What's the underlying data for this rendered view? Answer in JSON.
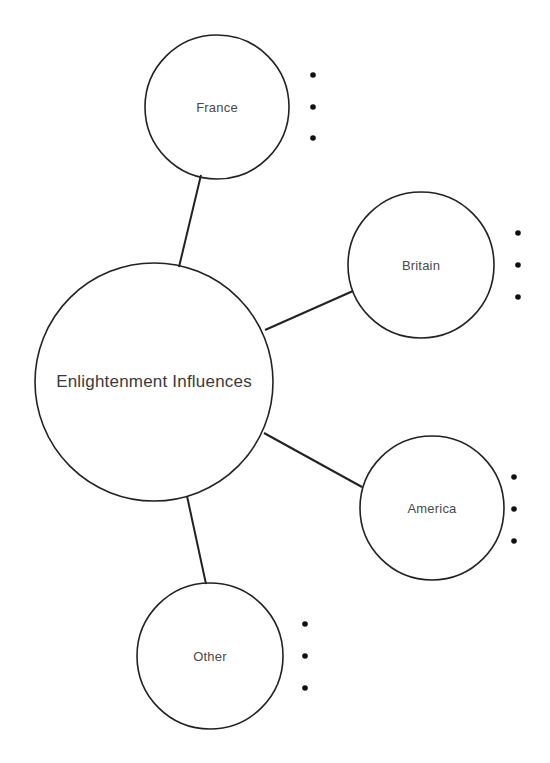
{
  "diagram": {
    "type": "mind-map",
    "stroke_color": "#222222",
    "text_color": "#4a4a4a",
    "background": "#ffffff",
    "center": {
      "label": "Enlightenment Influences",
      "cx": 154,
      "cy": 382,
      "r": 119
    },
    "nodes": [
      {
        "id": "france",
        "label": "France",
        "cx": 217,
        "cy": 107,
        "r": 72,
        "connector": [
          201,
          175,
          179,
          267
        ],
        "bullets": [
          {
            "x": 313,
            "y": 75
          },
          {
            "x": 313,
            "y": 107
          },
          {
            "x": 313,
            "y": 138
          }
        ]
      },
      {
        "id": "britain",
        "label": "Britain",
        "cx": 421,
        "cy": 265,
        "r": 73,
        "connector": [
          353,
          291,
          265,
          330
        ],
        "bullets": [
          {
            "x": 518,
            "y": 233
          },
          {
            "x": 518,
            "y": 265
          },
          {
            "x": 518,
            "y": 297
          }
        ]
      },
      {
        "id": "america",
        "label": "America",
        "cx": 432,
        "cy": 508,
        "r": 72,
        "connector": [
          264,
          433,
          362,
          487
        ],
        "bullets": [
          {
            "x": 514,
            "y": 477
          },
          {
            "x": 514,
            "y": 509
          },
          {
            "x": 514,
            "y": 541
          }
        ]
      },
      {
        "id": "other",
        "label": "Other",
        "cx": 210,
        "cy": 656,
        "r": 73,
        "connector": [
          187,
          496,
          206,
          584
        ],
        "bullets": [
          {
            "x": 305,
            "y": 624
          },
          {
            "x": 305,
            "y": 656
          },
          {
            "x": 305,
            "y": 688
          }
        ]
      }
    ]
  }
}
